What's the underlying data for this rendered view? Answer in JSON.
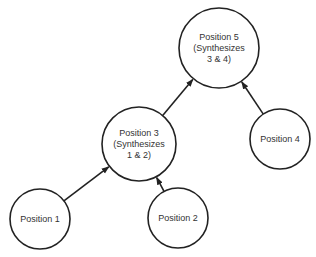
{
  "diagram": {
    "type": "synthesis-tree",
    "nodes": [
      {
        "id": "p5",
        "lines": [
          "Position 5",
          "(Synthesizes",
          "3 & 4)"
        ],
        "cx": 219,
        "cy": 48,
        "r": 40
      },
      {
        "id": "p3",
        "lines": [
          "Position 3",
          "(Synthesizes",
          "1 & 2)"
        ],
        "cx": 139,
        "cy": 144,
        "r": 37
      },
      {
        "id": "p4",
        "lines": [
          "Position 4"
        ],
        "cx": 280,
        "cy": 139,
        "r": 30
      },
      {
        "id": "p1",
        "lines": [
          "Position 1"
        ],
        "cx": 40,
        "cy": 219,
        "r": 30
      },
      {
        "id": "p2",
        "lines": [
          "Position 2"
        ],
        "cx": 178,
        "cy": 218,
        "r": 30
      }
    ],
    "edges": [
      {
        "from": "p3",
        "to": "p5"
      },
      {
        "from": "p4",
        "to": "p5"
      },
      {
        "from": "p1",
        "to": "p3"
      },
      {
        "from": "p2",
        "to": "p3"
      }
    ]
  }
}
